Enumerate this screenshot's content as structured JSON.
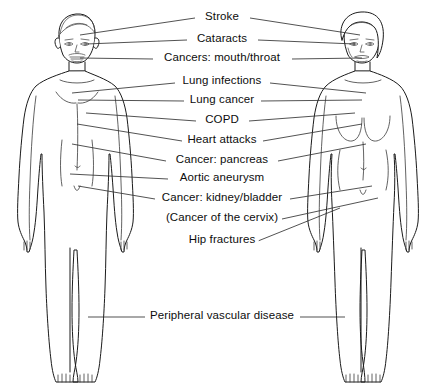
{
  "diagram": {
    "background_color": "#ffffff",
    "line_color": "#333333",
    "text_color": "#0d0d0d",
    "figures": [
      {
        "name": "male-figure",
        "side": "left",
        "label": "Male body outline"
      },
      {
        "name": "female-figure",
        "side": "right",
        "label": "Female body outline"
      }
    ],
    "labels": [
      {
        "id": "stroke",
        "text": "Stroke",
        "cx": 222,
        "cy": 17,
        "sides": "both"
      },
      {
        "id": "cataracts",
        "text": "Cataracts",
        "cx": 222,
        "cy": 39,
        "sides": "both"
      },
      {
        "id": "mouth-throat",
        "text": "Cancers: mouth/throat",
        "cx": 222,
        "cy": 58,
        "sides": "both"
      },
      {
        "id": "lung-infect",
        "text": "Lung infections",
        "cx": 222,
        "cy": 81,
        "sides": "both"
      },
      {
        "id": "lung-cancer",
        "text": "Lung cancer",
        "cx": 222,
        "cy": 100,
        "sides": "both"
      },
      {
        "id": "copd",
        "text": "COPD",
        "cx": 222,
        "cy": 120,
        "sides": "both"
      },
      {
        "id": "heart-attack",
        "text": "Heart attacks",
        "cx": 222,
        "cy": 140,
        "sides": "both"
      },
      {
        "id": "pancreas",
        "text": "Cancer: pancreas",
        "cx": 222,
        "cy": 160,
        "sides": "both"
      },
      {
        "id": "aortic",
        "text": "Aortic aneurysm",
        "cx": 222,
        "cy": 178,
        "sides": "left"
      },
      {
        "id": "kidney",
        "text": "Cancer: kidney/bladder",
        "cx": 222,
        "cy": 198,
        "sides": "both"
      },
      {
        "id": "cervix",
        "text": "(Cancer of the cervix)",
        "cx": 222,
        "cy": 218,
        "sides": "right"
      },
      {
        "id": "hip",
        "text": "Hip fractures",
        "cx": 222,
        "cy": 240,
        "sides": "right"
      },
      {
        "id": "pvd",
        "text": "Peripheral vascular disease",
        "cx": 222,
        "cy": 316,
        "sides": "both"
      }
    ]
  }
}
